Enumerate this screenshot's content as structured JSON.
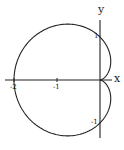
{
  "chart_data": {
    "type": "line",
    "title": "",
    "xlabel": "x",
    "ylabel": "y",
    "series": [
      {
        "name": "cardioid",
        "equation": "r = 1 - cos(theta)",
        "points": [
          {
            "x": 0,
            "y": 0
          },
          {
            "x": -0.5,
            "y": 0.866
          },
          {
            "x": 0,
            "y": 1
          },
          {
            "x": -1,
            "y": 1
          },
          {
            "x": -1.5,
            "y": 0.866
          },
          {
            "x": -2,
            "y": 0
          },
          {
            "x": -1.5,
            "y": -0.866
          },
          {
            "x": -1,
            "y": -1
          },
          {
            "x": 0,
            "y": -1
          },
          {
            "x": -0.5,
            "y": -0.866
          }
        ]
      }
    ],
    "x_ticks": [
      "-2",
      "-1"
    ],
    "y_ticks": [
      "1",
      "-1"
    ],
    "xlim": [
      -2.2,
      0.3
    ],
    "ylim": [
      -1.35,
      1.4
    ],
    "grid": false,
    "legend": "none"
  },
  "labels": {
    "x_axis": "x",
    "y_axis": "y",
    "tick_x_neg2": "-2",
    "tick_x_neg1": "-1",
    "tick_y_pos1": "1",
    "tick_y_neg1": "-1"
  },
  "colors": {
    "curve": "#222222",
    "axes": "#222222",
    "background": "#ffffff"
  }
}
